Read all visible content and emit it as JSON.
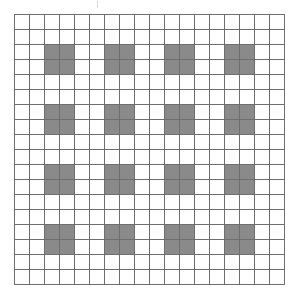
{
  "figure": {
    "title": "",
    "caption": ""
  },
  "artifact": {
    "name": "scan-tick-mark",
    "visible": true
  },
  "grid": {
    "rows": 18,
    "columns": 18,
    "cell_size_px": 15,
    "line_color": "#6e6e6e",
    "empty_cell_color": "#ffffff",
    "filled_cell_color": "#8a8a8a",
    "background_color": "#ffffff",
    "border_color": "#6e6e6e",
    "block_size": 2,
    "block_row_starts": [
      2,
      6,
      10,
      14
    ],
    "block_col_starts": [
      2,
      6,
      10,
      14
    ],
    "block_count": 25,
    "filled_cell_count": 100,
    "filled_cells": [
      [
        2,
        2
      ],
      [
        2,
        3
      ],
      [
        3,
        2
      ],
      [
        3,
        3
      ],
      [
        2,
        6
      ],
      [
        2,
        7
      ],
      [
        3,
        6
      ],
      [
        3,
        7
      ],
      [
        2,
        10
      ],
      [
        2,
        11
      ],
      [
        3,
        10
      ],
      [
        3,
        11
      ],
      [
        2,
        14
      ],
      [
        2,
        15
      ],
      [
        3,
        14
      ],
      [
        3,
        15
      ],
      [
        6,
        2
      ],
      [
        6,
        3
      ],
      [
        7,
        2
      ],
      [
        7,
        3
      ],
      [
        6,
        6
      ],
      [
        6,
        7
      ],
      [
        7,
        6
      ],
      [
        7,
        7
      ],
      [
        6,
        10
      ],
      [
        6,
        11
      ],
      [
        7,
        10
      ],
      [
        7,
        11
      ],
      [
        6,
        14
      ],
      [
        6,
        15
      ],
      [
        7,
        14
      ],
      [
        7,
        15
      ],
      [
        10,
        2
      ],
      [
        10,
        3
      ],
      [
        11,
        2
      ],
      [
        11,
        3
      ],
      [
        10,
        6
      ],
      [
        10,
        7
      ],
      [
        11,
        6
      ],
      [
        11,
        7
      ],
      [
        10,
        10
      ],
      [
        10,
        11
      ],
      [
        11,
        10
      ],
      [
        11,
        11
      ],
      [
        10,
        14
      ],
      [
        10,
        15
      ],
      [
        11,
        14
      ],
      [
        11,
        15
      ],
      [
        14,
        2
      ],
      [
        14,
        3
      ],
      [
        15,
        2
      ],
      [
        15,
        3
      ],
      [
        14,
        6
      ],
      [
        14,
        7
      ],
      [
        15,
        6
      ],
      [
        15,
        7
      ],
      [
        14,
        10
      ],
      [
        14,
        11
      ],
      [
        15,
        10
      ],
      [
        15,
        11
      ],
      [
        14,
        14
      ],
      [
        14,
        15
      ],
      [
        15,
        14
      ],
      [
        15,
        15
      ],
      [
        2,
        18
      ],
      [
        3,
        18
      ],
      [
        6,
        18
      ],
      [
        7,
        18
      ],
      [
        10,
        18
      ],
      [
        11,
        18
      ],
      [
        14,
        18
      ],
      [
        15,
        18
      ],
      [
        18,
        2
      ],
      [
        18,
        3
      ],
      [
        18,
        6
      ],
      [
        18,
        7
      ],
      [
        18,
        10
      ],
      [
        18,
        11
      ],
      [
        18,
        14
      ],
      [
        18,
        15
      ]
    ]
  }
}
